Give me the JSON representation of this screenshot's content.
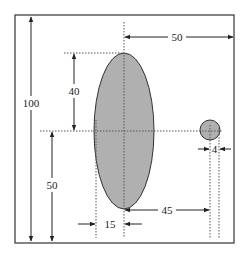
{
  "diagram": {
    "frame": {
      "x": 15,
      "y": 15,
      "width": 219,
      "height": 228
    },
    "colors": {
      "shape_fill": "#b0b0b0",
      "stroke": "#333333",
      "background": "#ffffff"
    },
    "shapes": {
      "ellipse": {
        "cx": 124,
        "cy": 131,
        "rx": 30,
        "ry": 78
      },
      "circle": {
        "cx": 210,
        "cy": 130,
        "r": 10
      }
    },
    "dimensions": {
      "total_height": {
        "label": "100"
      },
      "upper_height": {
        "label": "40"
      },
      "lower_height": {
        "label": "50"
      },
      "top_width": {
        "label": "50"
      },
      "ellipse_half_width": {
        "label": "15"
      },
      "center_distance": {
        "label": "45"
      },
      "circle_radius": {
        "label": "4"
      }
    }
  }
}
